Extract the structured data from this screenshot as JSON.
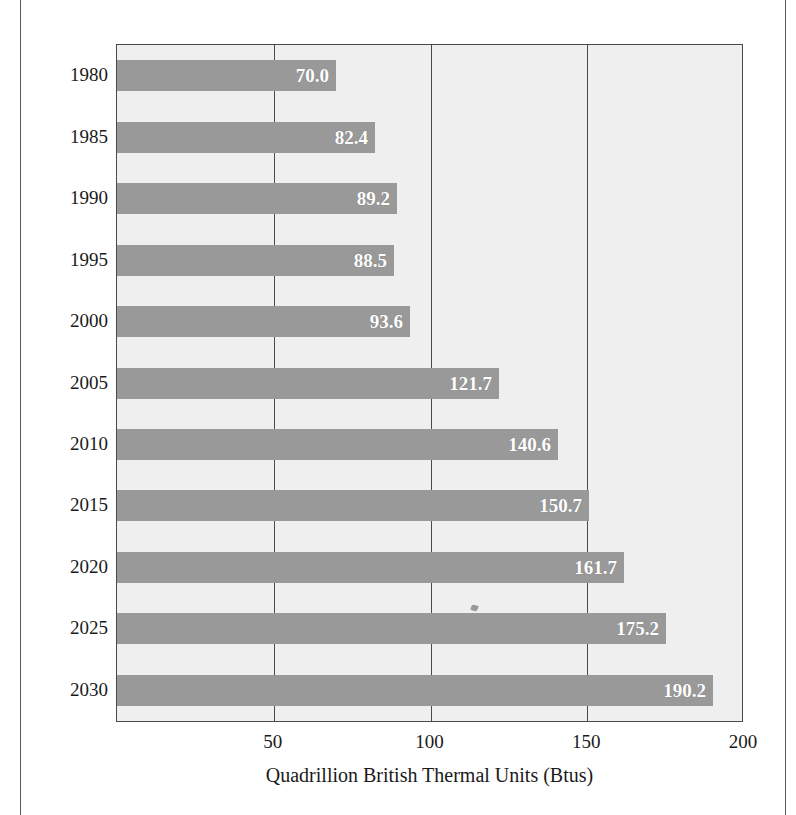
{
  "chart_data": {
    "type": "bar",
    "orientation": "horizontal",
    "title": "",
    "title_cropped": true,
    "categories": [
      "1980",
      "1985",
      "1990",
      "1995",
      "2000",
      "2005",
      "2010",
      "2015",
      "2020",
      "2025",
      "2030"
    ],
    "values": [
      70.0,
      82.4,
      89.2,
      88.5,
      93.6,
      121.7,
      140.6,
      150.7,
      161.7,
      175.2,
      190.2
    ],
    "value_labels": [
      "70.0",
      "82.4",
      "89.2",
      "88.5",
      "93.6",
      "121.7",
      "140.6",
      "150.7",
      "161.7",
      "175.2",
      "190.2"
    ],
    "xlabel": "Quadrillion British Thermal Units (Btus)",
    "ylabel": "",
    "xlim": [
      0,
      200
    ],
    "xticks": [
      50,
      100,
      150,
      200
    ],
    "xtick_labels": [
      "50",
      "100",
      "150",
      "200"
    ],
    "grid": true,
    "grid_axis": "x",
    "legend": null,
    "bar_color": "#999999",
    "plot_background": "#efefef",
    "axis_color": "#4a4a4a",
    "value_label_color": "#ffffff",
    "text_color": "#1a1a1a"
  }
}
